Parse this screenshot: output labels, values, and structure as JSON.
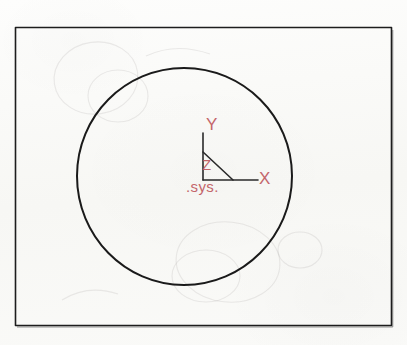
{
  "sheet": {
    "medium": "hand-drawn pencil sketch on paper",
    "background_color": "#fbfbf9"
  },
  "frame": {
    "name": "outer-rectangle",
    "x": 15,
    "y": 27,
    "width": 377,
    "height": 299,
    "stroke_color": "#1d1d1d",
    "stroke_width": 1.6
  },
  "circle": {
    "name": "main-circle",
    "cx": 184,
    "cy": 176,
    "r": 108,
    "stroke_color": "#1a1a1a",
    "stroke_width": 2.0
  },
  "axes": {
    "origin_x": 203,
    "origin_y": 180,
    "stroke_color": "#2a2a2a",
    "stroke_width": 1.5,
    "y_axis_top": 133,
    "x_axis_right": 258,
    "diagonal": {
      "x1": 203,
      "y1": 152,
      "x2": 233,
      "y2": 180
    }
  },
  "labels": {
    "y": "Y",
    "x": "X",
    "z": "Z",
    "sys": ".sys.",
    "color": "#c0595f"
  },
  "ghost_marks": {
    "description": "faint erased pencil construction circles",
    "color": "rgba(150,140,140,0.16)"
  }
}
